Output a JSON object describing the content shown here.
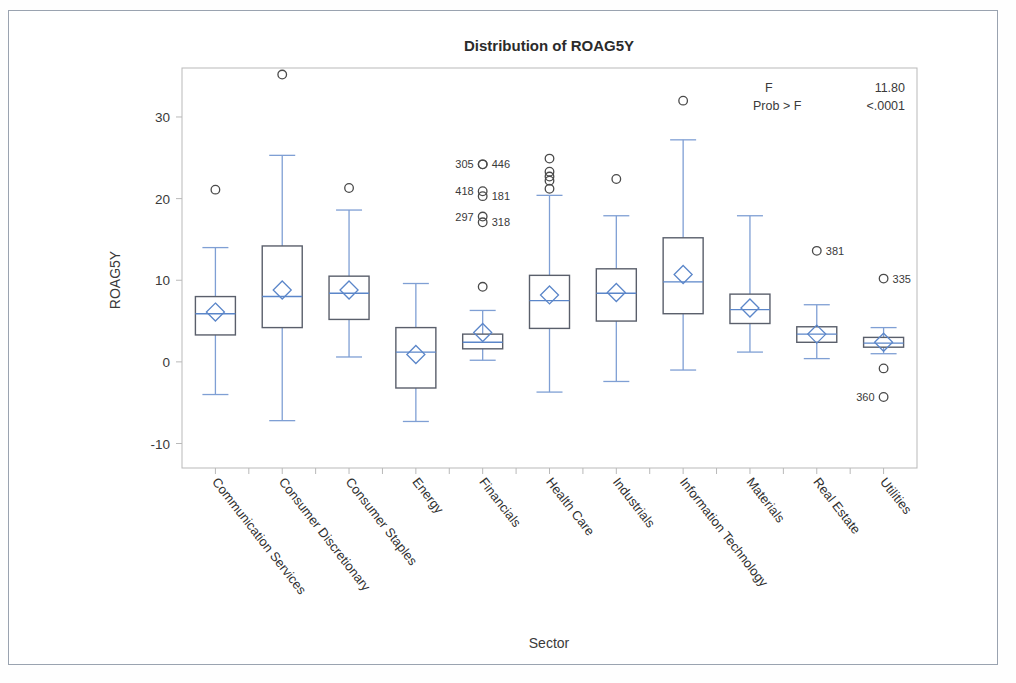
{
  "chart_data": {
    "type": "box",
    "title": "Distribution of ROAG5Y",
    "xlabel": "Sector",
    "ylabel": "ROAG5Y",
    "ylim": [
      -13,
      36
    ],
    "yticks": [
      -10,
      0,
      10,
      20,
      30
    ],
    "ytick_labels": [
      "-10",
      "0",
      "10",
      "20",
      "30"
    ],
    "grid": false,
    "legend": "none",
    "categories": [
      "Communication Services",
      "Consumer Discretionary",
      "Consumer Staples",
      "Energy",
      "Financials",
      "Health Care",
      "Industrials",
      "Information Technology",
      "Materials",
      "Real Estate",
      "Utilities"
    ],
    "boxes": [
      {
        "category": "Communication Services",
        "min": -4.0,
        "q1": 3.3,
        "median": 5.9,
        "q3": 8.0,
        "max": 14.0,
        "mean": 6.1,
        "outliers": [
          {
            "value": 21.1,
            "label": ""
          }
        ]
      },
      {
        "category": "Consumer Discretionary",
        "min": -7.2,
        "q1": 4.2,
        "median": 8.0,
        "q3": 14.2,
        "max": 25.3,
        "mean": 8.8,
        "outliers": [
          {
            "value": 35.2,
            "label": ""
          }
        ]
      },
      {
        "category": "Consumer Staples",
        "min": 0.6,
        "q1": 5.2,
        "median": 8.4,
        "q3": 10.5,
        "max": 18.6,
        "mean": 8.8,
        "outliers": [
          {
            "value": 21.3,
            "label": ""
          }
        ]
      },
      {
        "category": "Energy",
        "min": -7.3,
        "q1": -3.2,
        "median": 1.2,
        "q3": 4.2,
        "max": 9.6,
        "mean": 0.9,
        "outliers": []
      },
      {
        "category": "Financials",
        "min": 0.2,
        "q1": 1.6,
        "median": 2.4,
        "q3": 3.4,
        "max": 6.3,
        "mean": 3.6,
        "outliers": [
          {
            "value": 24.2,
            "label": "305",
            "label_side": "left"
          },
          {
            "value": 24.2,
            "label": "446",
            "label_side": "right"
          },
          {
            "value": 20.9,
            "label": "418",
            "label_side": "left"
          },
          {
            "value": 20.3,
            "label": "181",
            "label_side": "right"
          },
          {
            "value": 17.8,
            "label": "297",
            "label_side": "left"
          },
          {
            "value": 17.1,
            "label": "318",
            "label_side": "right"
          },
          {
            "value": 9.2,
            "label": ""
          }
        ]
      },
      {
        "category": "Health Care",
        "min": -3.7,
        "q1": 4.1,
        "median": 7.5,
        "q3": 10.6,
        "max": 20.4,
        "mean": 8.2,
        "outliers": [
          {
            "value": 24.9,
            "label": ""
          },
          {
            "value": 23.3,
            "label": ""
          },
          {
            "value": 22.7,
            "label": ""
          },
          {
            "value": 22.2,
            "label": ""
          },
          {
            "value": 21.2,
            "label": ""
          }
        ]
      },
      {
        "category": "Industrials",
        "min": -2.4,
        "q1": 5.0,
        "median": 8.4,
        "q3": 11.4,
        "max": 17.9,
        "mean": 8.5,
        "outliers": [
          {
            "value": 22.4,
            "label": ""
          }
        ]
      },
      {
        "category": "Information Technology",
        "min": -1.0,
        "q1": 5.9,
        "median": 9.8,
        "q3": 15.2,
        "max": 27.2,
        "mean": 10.7,
        "outliers": [
          {
            "value": 32.0,
            "label": ""
          }
        ]
      },
      {
        "category": "Materials",
        "min": 1.2,
        "q1": 4.7,
        "median": 6.4,
        "q3": 8.3,
        "max": 17.9,
        "mean": 6.6,
        "outliers": []
      },
      {
        "category": "Real Estate",
        "min": 0.4,
        "q1": 2.4,
        "median": 3.4,
        "q3": 4.3,
        "max": 7.0,
        "mean": 3.4,
        "outliers": [
          {
            "value": 13.6,
            "label": "381",
            "label_side": "right"
          }
        ]
      },
      {
        "category": "Utilities",
        "min": 1.0,
        "q1": 1.8,
        "median": 2.3,
        "q3": 3.0,
        "max": 4.2,
        "mean": 2.4,
        "outliers": [
          {
            "value": 10.2,
            "label": "335",
            "label_side": "right"
          },
          {
            "value": -0.8,
            "label": ""
          },
          {
            "value": -4.3,
            "label": "360",
            "label_side": "left"
          }
        ]
      }
    ],
    "annotations": {
      "f_label": "F",
      "f_value": "11.80",
      "prob_label": "Prob > F",
      "prob_value": "<.0001"
    },
    "colors": {
      "box_stroke": "#5a5f6b",
      "whisker": "#7f9fd4",
      "median": "#5b86c9",
      "mean_marker": "#5b86c9",
      "outlier": "#4a4a4a",
      "axis": "#b9b9b9",
      "text": "#2b2b2b"
    }
  }
}
